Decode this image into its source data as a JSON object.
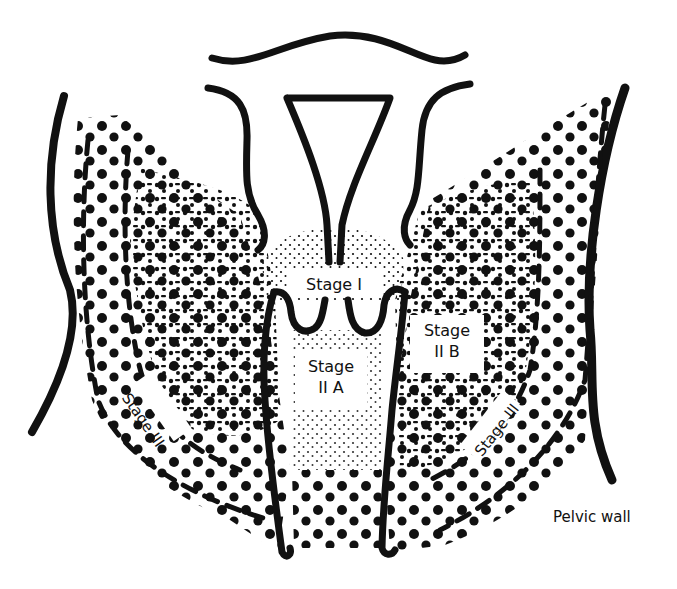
{
  "diagram": {
    "colors": {
      "ink": "#111111",
      "background": "#ffffff"
    },
    "labels": {
      "stage_1": "Stage I",
      "stage_2a_line1": "Stage",
      "stage_2a_line2": "II A",
      "stage_2b_line1": "Stage",
      "stage_2b_line2": "II B",
      "stage_3_left": "Stage III",
      "stage_3_right": "Stage III",
      "pelvic_wall": "Pelvic wall"
    },
    "regions": [
      {
        "id": "stage-1",
        "description": "Cervix region, finely stippled dome beneath uterus"
      },
      {
        "id": "stage-2a",
        "description": "Upper vagina, between vaginal walls, light stipple"
      },
      {
        "id": "stage-2b",
        "description": "Parametria, medium dot stipple either side"
      },
      {
        "id": "stage-3",
        "description": "Large dots extending to the pelvic side walls"
      }
    ],
    "structures": [
      "uterus-fundus-outline",
      "uterine-cavity",
      "cervix",
      "vaginal-walls",
      "left-pelvic-wall",
      "right-pelvic-wall"
    ]
  }
}
